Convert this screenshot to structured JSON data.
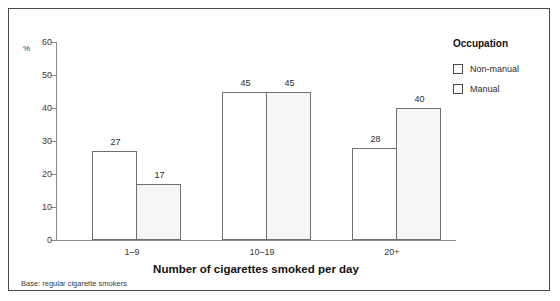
{
  "chart_data": {
    "type": "bar",
    "title": "Number of cigarettes smoked per day",
    "xlabel": "Number of cigarettes smoked per day",
    "ylabel": "%",
    "categories": [
      "1–9",
      "10–19",
      "20+"
    ],
    "series": [
      {
        "name": "Non-manual",
        "values": [
          27,
          45,
          28
        ],
        "color": "#ffffff"
      },
      {
        "name": "Manual",
        "values": [
          17,
          45,
          40
        ],
        "color": "#f5f6f7"
      }
    ],
    "ylim": [
      0,
      60
    ],
    "yticks": [
      0,
      10,
      20,
      30,
      40,
      50,
      60
    ],
    "grid": false,
    "legend_position": "right",
    "legend_title": "Occupation",
    "footnote": "Base: regular cigarette smokers"
  },
  "axis": {
    "unit_label": "%",
    "ticks": [
      "0",
      "10",
      "20",
      "30",
      "40",
      "50",
      "60"
    ]
  },
  "legend": {
    "title": "Occupation",
    "items": [
      {
        "label": "Non-manual"
      },
      {
        "label": "Manual"
      }
    ]
  },
  "groups": [
    {
      "category": "1–9",
      "bars": [
        {
          "series": "Non-manual",
          "value": "27"
        },
        {
          "series": "Manual",
          "value": "17"
        }
      ]
    },
    {
      "category": "10–19",
      "bars": [
        {
          "series": "Non-manual",
          "value": "45"
        },
        {
          "series": "Manual",
          "value": "45"
        }
      ]
    },
    {
      "category": "20+",
      "bars": [
        {
          "series": "Non-manual",
          "value": "28"
        },
        {
          "series": "Manual",
          "value": "40"
        }
      ]
    }
  ],
  "title": "Number of cigarettes smoked per day",
  "footnote": "Base: regular cigarette smokers"
}
